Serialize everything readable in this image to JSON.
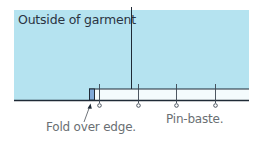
{
  "diagram": {
    "labels": {
      "garment": "Outside of garment",
      "fold": "Fold over edge.",
      "pin": "Pin-baste."
    },
    "colors": {
      "garment_fill": "#b5e3f0",
      "strip_fill": "#f4fbfd",
      "fold_fill": "#7fa8d8",
      "line": "#1f2a36",
      "pin": "#3a4450"
    },
    "pins": {
      "count": 4,
      "x_positions": [
        99,
        138,
        176,
        215
      ]
    }
  }
}
